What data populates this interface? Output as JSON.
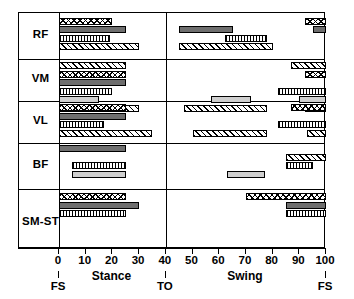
{
  "figure": {
    "axis": {
      "min": 0,
      "max": 100,
      "ticks": [
        0,
        10,
        20,
        30,
        40,
        50,
        60,
        70,
        80,
        90,
        100
      ],
      "tick_labels": [
        "0",
        "10",
        "20",
        "30",
        "40",
        "50",
        "60",
        "70",
        "80",
        "90",
        "100"
      ],
      "events": [
        {
          "label": "FS",
          "value": 0
        },
        {
          "label": "TO",
          "value": 40
        },
        {
          "label": "FS",
          "value": 100
        }
      ],
      "phases": [
        {
          "label": "Stance",
          "center": 20
        },
        {
          "label": "Swing",
          "center": 70
        }
      ]
    },
    "muscles": [
      "RF",
      "VM",
      "VL",
      "BF",
      "SM-ST"
    ],
    "patterns": {
      "cross": "crosshatch",
      "dark": "dark-gray-solid",
      "vert": "vertical-stripe",
      "light": "light-gray-solid",
      "diag": "diagonal-hatch"
    }
  },
  "chart_data": {
    "type": "bar",
    "xlabel": "% Gait cycle",
    "ylabel": "Muscle",
    "xlim": [
      0,
      100
    ],
    "grid": false,
    "legend": "none",
    "orientation": "horizontal-ranges",
    "categories": [
      "RF",
      "VM",
      "VL",
      "BF",
      "SM-ST"
    ],
    "series": [
      {
        "muscle": "RF",
        "bars": [
          {
            "pattern": "cross",
            "segments": [
              [
                0,
                20
              ],
              [
                92,
                100
              ]
            ]
          },
          {
            "pattern": "dark",
            "segments": [
              [
                0,
                25
              ],
              [
                45,
                65
              ],
              [
                95,
                100
              ]
            ]
          },
          {
            "pattern": "vert",
            "segments": [
              [
                0,
                19
              ],
              [
                62,
                78
              ]
            ]
          },
          {
            "pattern": "diag",
            "segments": [
              [
                0,
                30
              ],
              [
                45,
                80
              ]
            ]
          }
        ]
      },
      {
        "muscle": "VM",
        "bars": [
          {
            "pattern": "diag",
            "segments": [
              [
                0,
                25
              ],
              [
                87,
                100
              ]
            ]
          },
          {
            "pattern": "cross",
            "segments": [
              [
                0,
                25
              ],
              [
                92,
                100
              ]
            ]
          },
          {
            "pattern": "dark",
            "segments": [
              [
                0,
                25
              ]
            ]
          },
          {
            "pattern": "vert",
            "segments": [
              [
                0,
                20
              ],
              [
                82,
                100
              ]
            ]
          },
          {
            "pattern": "light",
            "segments": [
              [
                0,
                15
              ],
              [
                57,
                72
              ],
              [
                90,
                100
              ]
            ]
          },
          {
            "pattern": "diag",
            "segments": [
              [
                0,
                30
              ],
              [
                47,
                78
              ],
              [
                92,
                100
              ]
            ]
          }
        ]
      },
      {
        "muscle": "VL",
        "bars": [
          {
            "pattern": "cross",
            "segments": [
              [
                0,
                25
              ],
              [
                87,
                100
              ]
            ]
          },
          {
            "pattern": "dark",
            "segments": [
              [
                0,
                25
              ]
            ]
          },
          {
            "pattern": "vert",
            "segments": [
              [
                0,
                17
              ],
              [
                82,
                100
              ]
            ]
          },
          {
            "pattern": "diag",
            "segments": [
              [
                0,
                35
              ],
              [
                50,
                78
              ],
              [
                93,
                100
              ]
            ]
          }
        ]
      },
      {
        "muscle": "BF",
        "bars": [
          {
            "pattern": "dark",
            "segments": [
              [
                0,
                25
              ]
            ]
          },
          {
            "pattern": "diag",
            "segments": [
              [
                85,
                100
              ]
            ]
          },
          {
            "pattern": "vert",
            "segments": [
              [
                5,
                25
              ],
              [
                85,
                95
              ]
            ]
          },
          {
            "pattern": "light",
            "segments": [
              [
                5,
                25
              ],
              [
                63,
                77
              ]
            ]
          }
        ]
      },
      {
        "muscle": "SM-ST",
        "bars": [
          {
            "pattern": "cross",
            "segments": [
              [
                0,
                25
              ],
              [
                70,
                100
              ]
            ]
          },
          {
            "pattern": "dark",
            "segments": [
              [
                0,
                30
              ],
              [
                85,
                100
              ]
            ]
          },
          {
            "pattern": "vert",
            "segments": [
              [
                0,
                25
              ],
              [
                85,
                100
              ]
            ]
          }
        ]
      }
    ]
  }
}
